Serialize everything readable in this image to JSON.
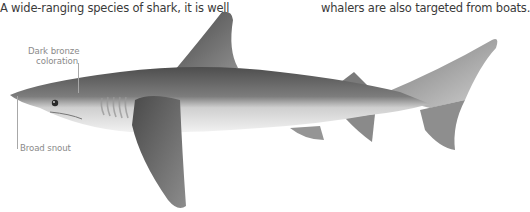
{
  "intro": {
    "left_text": "A wide-ranging species of shark, it is well",
    "right_text": "whalers are also targeted from boats."
  },
  "annotations": [
    {
      "label": "Dark bronze\ncoloration",
      "line1": "Dark bronze",
      "line2": "coloration"
    },
    {
      "label": "Broad snout"
    }
  ],
  "illustration": {
    "subject": "shark-side-view",
    "colors": {
      "body_dark": "#5c5c5c",
      "body_mid": "#8a8a8a",
      "belly": "#ededed",
      "fin": "#6a6a6a",
      "text": "#3a3a3a",
      "label": "#8a8a8a"
    }
  }
}
